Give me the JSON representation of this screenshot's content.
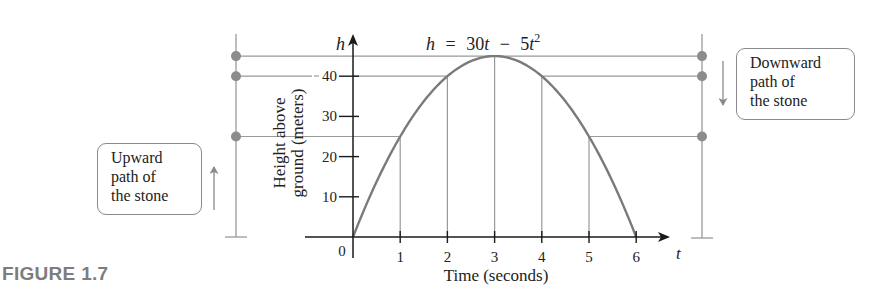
{
  "figure": {
    "label": "FIGURE 1.7",
    "equation": {
      "lhs": "h",
      "eq": "=",
      "a": "30",
      "var1": "t",
      "minus": "−",
      "b": "5",
      "var2": "t",
      "exp": "2"
    },
    "y_axis_var": "h",
    "x_axis_var": "t",
    "y_axis_title_line1": "Height above",
    "y_axis_title_line2": "ground (meters)",
    "x_axis_title": "Time (seconds)",
    "origin_label": "0",
    "x_ticks": [
      "1",
      "2",
      "3",
      "4",
      "5",
      "6"
    ],
    "y_ticks": [
      "10",
      "20",
      "30",
      "40"
    ],
    "callout_up": {
      "lines": [
        "Upward",
        "path of",
        "the stone"
      ]
    },
    "callout_down": {
      "lines": [
        "Downward",
        "path of",
        "the stone"
      ]
    },
    "colors": {
      "curve": "#7a7a7a",
      "guide": "#9a9a9a",
      "axis": "#1a1a1a",
      "dot": "#8c8c8c",
      "figure_label": "#7d7d7d"
    }
  },
  "chart_data": {
    "type": "line",
    "xlabel": "Time (seconds)",
    "ylabel": "Height above ground (meters)",
    "x_var": "t",
    "y_var": "h",
    "xlim": [
      0,
      6.5
    ],
    "ylim": [
      0,
      48
    ],
    "x_ticks": [
      0,
      1,
      2,
      3,
      4,
      5,
      6
    ],
    "y_ticks": [
      10,
      20,
      30,
      40
    ],
    "grid": false,
    "series": [
      {
        "name": "h = 30t − 5t²",
        "x": [
          0,
          1,
          2,
          3,
          4,
          5,
          6
        ],
        "values": [
          0,
          25,
          40,
          45,
          40,
          25,
          0
        ]
      }
    ],
    "vertical_guides_at_t": [
      1,
      2,
      3,
      4,
      5
    ],
    "horizontal_guides_at_h": [
      25,
      40,
      45
    ],
    "annotations": [
      {
        "text": "Upward path of the stone",
        "side": "left",
        "arrow": "up",
        "markers_h": [
          25,
          40,
          45
        ]
      },
      {
        "text": "Downward path of the stone",
        "side": "right",
        "arrow": "down",
        "markers_h": [
          45,
          40,
          25
        ]
      }
    ]
  }
}
